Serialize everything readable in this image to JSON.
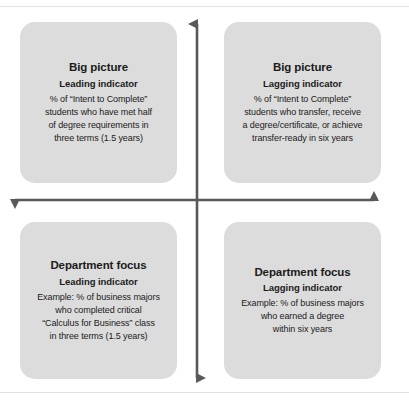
{
  "figure": {
    "name": "leading-lagging-indicator-matrix",
    "colors": {
      "card_background": "#dcdcdc",
      "axis": "#58595b",
      "text": "#1b1b1b",
      "frame_rule": "#e3e3e3",
      "page_background": "#ffffff"
    }
  },
  "axes": {
    "vertical": {
      "name": "vertical-axis",
      "arrowheads": "both",
      "top_label": "",
      "bottom_label": ""
    },
    "horizontal": {
      "name": "horizontal-axis",
      "arrowheads": "both",
      "left_label": "",
      "right_label": ""
    }
  },
  "quadrants": [
    {
      "position": "top-left",
      "title": "Big picture",
      "subtitle": "Leading indicator",
      "body": "% of “Intent to Complete”\nstudents who have met half\nof degree requirements in\nthree terms (1.5 years)"
    },
    {
      "position": "top-right",
      "title": "Big picture",
      "subtitle": "Lagging indicator",
      "body": "% of “Intent to Complete”\nstudents who transfer, receive\na degree/certificate, or achieve\ntransfer-ready in six years"
    },
    {
      "position": "bottom-left",
      "title": "Department focus",
      "subtitle": "Leading indicator",
      "body": "Example: % of business majors\nwho completed critical\n“Calculus for Business” class\nin three terms (1.5 years)"
    },
    {
      "position": "bottom-right",
      "title": "Department focus",
      "subtitle": "Lagging indicator",
      "body": "Example: % of business majors\nwho earned a degree\nwithin six years"
    }
  ]
}
